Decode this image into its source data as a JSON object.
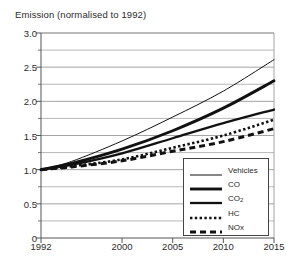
{
  "chart_data": {
    "type": "line",
    "title": "Emission (normalised to 1992)",
    "xlabel": "",
    "ylabel": "",
    "xlim": [
      1992,
      2015
    ],
    "ylim": [
      0,
      3.0
    ],
    "grid": true,
    "legend_position": "bottom-right",
    "x_ticks": [
      1992,
      2000,
      2005,
      2010,
      2015
    ],
    "x_tick_labels": [
      "1992",
      "2000",
      "2005",
      "2010",
      "2015"
    ],
    "y_ticks": [
      0,
      0.5,
      1.0,
      1.5,
      2.0,
      2.5,
      3.0
    ],
    "y_tick_labels": [
      "0",
      "0.5",
      "1.0",
      "1.5",
      "2.0",
      "2.5",
      "3.0"
    ],
    "y_minor_ticks": [
      0.25,
      0.75,
      1.25,
      1.75,
      2.25,
      2.75
    ],
    "x": [
      1992,
      1995,
      2000,
      2005,
      2010,
      2015
    ],
    "series": [
      {
        "name": "Vehicles",
        "style": "thin-solid",
        "values": [
          1.0,
          1.12,
          1.42,
          1.77,
          2.15,
          2.61
        ]
      },
      {
        "name": "CO",
        "style": "thick-solid",
        "values": [
          1.0,
          1.09,
          1.3,
          1.57,
          1.9,
          2.3
        ]
      },
      {
        "name": "CO2",
        "label": "CO₂",
        "style": "medium-solid",
        "values": [
          1.0,
          1.07,
          1.24,
          1.46,
          1.68,
          1.88
        ]
      },
      {
        "name": "HC",
        "style": "dotted",
        "values": [
          1.0,
          1.05,
          1.15,
          1.32,
          1.5,
          1.73
        ]
      },
      {
        "name": "NOx",
        "style": "dashed",
        "values": [
          1.0,
          1.04,
          1.13,
          1.27,
          1.41,
          1.6
        ]
      }
    ]
  },
  "legend": {
    "items": [
      {
        "label": "Vehicles"
      },
      {
        "label": "CO"
      },
      {
        "label": "CO",
        "sub": "2"
      },
      {
        "label": "HC"
      },
      {
        "label": "NOx"
      }
    ]
  },
  "colors": {
    "ink": "#111111",
    "grid": "#9a9a9a",
    "axis": "#555555",
    "background": "#ffffff"
  }
}
